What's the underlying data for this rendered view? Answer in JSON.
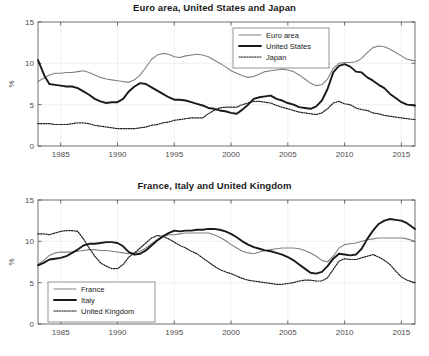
{
  "figure": {
    "background": "#ffffff",
    "axis_color": "#4d4d4d",
    "grid_color": "#e6e6e6"
  },
  "chart_data": [
    {
      "type": "line",
      "title": "Euro area, United States and Japan",
      "xlabel": "",
      "ylabel": "%",
      "xlim": [
        1983,
        2016.2
      ],
      "ylim": [
        0,
        15
      ],
      "xticks": [
        1985,
        1990,
        1995,
        2000,
        2005,
        2010,
        2015
      ],
      "yticks": [
        0,
        5,
        10,
        15
      ],
      "xticklabels": [
        "1985",
        "1990",
        "1995",
        "2000",
        "2005",
        "2010",
        "2015"
      ],
      "yticklabels": [
        "0",
        "5",
        "10",
        "15"
      ],
      "grid": true,
      "legend_position": "top-center-right",
      "series": [
        {
          "name": "Euro area",
          "color": "#808080",
          "style": "solid",
          "width": 1.1,
          "x": [
            1983.0,
            1983.5,
            1984.0,
            1984.5,
            1985.0,
            1985.5,
            1986.0,
            1986.5,
            1987.0,
            1987.5,
            1988.0,
            1988.5,
            1989.0,
            1989.5,
            1990.0,
            1990.5,
            1991.0,
            1991.5,
            1992.0,
            1992.5,
            1993.0,
            1993.5,
            1994.0,
            1994.5,
            1995.0,
            1995.5,
            1996.0,
            1996.5,
            1997.0,
            1997.5,
            1998.0,
            1998.5,
            1999.0,
            1999.5,
            2000.0,
            2000.5,
            2001.0,
            2001.5,
            2002.0,
            2002.5,
            2003.0,
            2003.5,
            2004.0,
            2004.5,
            2005.0,
            2005.5,
            2006.0,
            2006.5,
            2007.0,
            2007.5,
            2008.0,
            2008.5,
            2009.0,
            2009.5,
            2010.0,
            2010.5,
            2011.0,
            2011.5,
            2012.0,
            2012.5,
            2013.0,
            2013.5,
            2014.0,
            2014.5,
            2015.0,
            2015.5,
            2016.2
          ],
          "values": [
            7.8,
            8.2,
            8.6,
            8.8,
            8.8,
            8.9,
            8.9,
            9.0,
            9.1,
            8.9,
            8.6,
            8.3,
            8.1,
            8.0,
            7.9,
            7.8,
            7.7,
            8.0,
            8.6,
            9.5,
            10.5,
            11.0,
            11.2,
            11.1,
            10.8,
            10.7,
            10.9,
            11.0,
            11.1,
            11.0,
            10.8,
            10.4,
            10.0,
            9.6,
            9.1,
            8.8,
            8.5,
            8.3,
            8.4,
            8.7,
            9.0,
            9.1,
            9.2,
            9.3,
            9.2,
            9.0,
            8.6,
            8.1,
            7.6,
            7.3,
            7.4,
            8.1,
            9.4,
            10.0,
            10.1,
            10.1,
            10.2,
            10.6,
            11.3,
            11.9,
            12.1,
            12.0,
            11.7,
            11.3,
            10.9,
            10.5,
            10.3
          ]
        },
        {
          "name": "United States",
          "color": "#1a1a1a",
          "style": "solid",
          "width": 1.9,
          "x": [
            1983.0,
            1983.3,
            1983.6,
            1984.0,
            1984.5,
            1985.0,
            1985.5,
            1986.0,
            1986.5,
            1987.0,
            1987.5,
            1988.0,
            1988.5,
            1989.0,
            1989.5,
            1990.0,
            1990.5,
            1991.0,
            1991.5,
            1992.0,
            1992.5,
            1993.0,
            1993.5,
            1994.0,
            1994.5,
            1995.0,
            1995.5,
            1996.0,
            1996.5,
            1997.0,
            1997.5,
            1998.0,
            1998.5,
            1999.0,
            1999.5,
            2000.0,
            2000.5,
            2001.0,
            2001.5,
            2002.0,
            2002.5,
            2003.0,
            2003.5,
            2004.0,
            2004.5,
            2005.0,
            2005.5,
            2006.0,
            2006.5,
            2007.0,
            2007.5,
            2008.0,
            2008.5,
            2009.0,
            2009.5,
            2010.0,
            2010.5,
            2011.0,
            2011.5,
            2012.0,
            2012.5,
            2013.0,
            2013.5,
            2014.0,
            2014.5,
            2015.0,
            2015.5,
            2016.2
          ],
          "values": [
            10.4,
            9.4,
            8.4,
            7.5,
            7.4,
            7.3,
            7.2,
            7.2,
            7.0,
            6.6,
            6.2,
            5.7,
            5.4,
            5.2,
            5.3,
            5.3,
            5.7,
            6.6,
            7.2,
            7.6,
            7.5,
            7.1,
            6.7,
            6.3,
            5.9,
            5.6,
            5.6,
            5.5,
            5.3,
            5.1,
            4.9,
            4.6,
            4.5,
            4.3,
            4.2,
            4.0,
            3.9,
            4.4,
            5.0,
            5.7,
            5.9,
            6.0,
            6.1,
            5.7,
            5.5,
            5.2,
            5.0,
            4.7,
            4.6,
            4.5,
            4.8,
            5.5,
            6.9,
            8.9,
            9.7,
            9.9,
            9.6,
            9.0,
            8.9,
            8.3,
            7.9,
            7.4,
            7.0,
            6.3,
            5.8,
            5.3,
            5.0,
            4.9
          ]
        },
        {
          "name": "Japan",
          "color": "#1a1a1a",
          "style": "dotted",
          "width": 1.2,
          "x": [
            1983.0,
            1983.5,
            1984.0,
            1984.5,
            1985.0,
            1985.5,
            1986.0,
            1986.5,
            1987.0,
            1987.5,
            1988.0,
            1988.5,
            1989.0,
            1989.5,
            1990.0,
            1990.5,
            1991.0,
            1991.5,
            1992.0,
            1992.5,
            1993.0,
            1993.5,
            1994.0,
            1994.5,
            1995.0,
            1995.5,
            1996.0,
            1996.5,
            1997.0,
            1997.5,
            1998.0,
            1998.5,
            1999.0,
            1999.5,
            2000.0,
            2000.5,
            2001.0,
            2001.5,
            2002.0,
            2002.5,
            2003.0,
            2003.5,
            2004.0,
            2004.5,
            2005.0,
            2005.5,
            2006.0,
            2006.5,
            2007.0,
            2007.5,
            2008.0,
            2008.5,
            2009.0,
            2009.5,
            2010.0,
            2010.5,
            2011.0,
            2011.5,
            2012.0,
            2012.5,
            2013.0,
            2013.5,
            2014.0,
            2014.5,
            2015.0,
            2015.5,
            2016.2
          ],
          "values": [
            2.7,
            2.7,
            2.7,
            2.6,
            2.6,
            2.6,
            2.7,
            2.8,
            2.8,
            2.7,
            2.5,
            2.4,
            2.3,
            2.2,
            2.1,
            2.1,
            2.1,
            2.1,
            2.2,
            2.3,
            2.5,
            2.6,
            2.8,
            2.9,
            3.1,
            3.2,
            3.3,
            3.4,
            3.4,
            3.4,
            3.9,
            4.3,
            4.6,
            4.7,
            4.7,
            4.7,
            5.0,
            5.2,
            5.4,
            5.4,
            5.3,
            5.2,
            4.9,
            4.7,
            4.5,
            4.3,
            4.1,
            4.0,
            3.9,
            3.8,
            4.0,
            4.5,
            5.2,
            5.4,
            5.1,
            5.0,
            4.6,
            4.4,
            4.3,
            4.0,
            3.9,
            3.7,
            3.6,
            3.5,
            3.4,
            3.3,
            3.2
          ]
        }
      ]
    },
    {
      "type": "line",
      "title": "France, Italy and United Kingdom",
      "xlabel": "",
      "ylabel": "%",
      "xlim": [
        1983,
        2016.2
      ],
      "ylim": [
        0,
        15
      ],
      "xticks": [
        1985,
        1990,
        1995,
        2000,
        2005,
        2010,
        2015
      ],
      "yticks": [
        0,
        5,
        10,
        15
      ],
      "xticklabels": [
        "1985",
        "1990",
        "1995",
        "2000",
        "2005",
        "2010",
        "2015"
      ],
      "yticklabels": [
        "0",
        "5",
        "10",
        "15"
      ],
      "grid": true,
      "legend_position": "bottom-left",
      "series": [
        {
          "name": "France",
          "color": "#808080",
          "style": "solid",
          "width": 1.1,
          "x": [
            1983.0,
            1983.5,
            1984.0,
            1984.5,
            1985.0,
            1985.5,
            1986.0,
            1986.5,
            1987.0,
            1987.5,
            1988.0,
            1988.5,
            1989.0,
            1989.5,
            1990.0,
            1990.5,
            1991.0,
            1991.5,
            1992.0,
            1992.5,
            1993.0,
            1993.5,
            1994.0,
            1994.5,
            1995.0,
            1995.5,
            1996.0,
            1996.5,
            1997.0,
            1997.5,
            1998.0,
            1998.5,
            1999.0,
            1999.5,
            2000.0,
            2000.5,
            2001.0,
            2001.5,
            2002.0,
            2002.5,
            2003.0,
            2003.5,
            2004.0,
            2004.5,
            2005.0,
            2005.5,
            2006.0,
            2006.5,
            2007.0,
            2007.5,
            2008.0,
            2008.5,
            2009.0,
            2009.5,
            2010.0,
            2010.5,
            2011.0,
            2011.5,
            2012.0,
            2012.5,
            2013.0,
            2013.5,
            2014.0,
            2014.5,
            2015.0,
            2015.5,
            2016.2
          ],
          "values": [
            7.2,
            7.7,
            8.3,
            8.6,
            8.7,
            8.7,
            8.7,
            8.8,
            8.9,
            9.0,
            9.0,
            8.9,
            8.9,
            8.8,
            8.7,
            8.6,
            8.5,
            8.6,
            8.8,
            9.2,
            9.7,
            10.2,
            10.6,
            10.8,
            10.8,
            10.9,
            11.0,
            11.0,
            11.0,
            11.0,
            11.0,
            10.8,
            10.5,
            10.1,
            9.6,
            9.2,
            8.8,
            8.6,
            8.5,
            8.7,
            8.9,
            9.0,
            9.1,
            9.2,
            9.2,
            9.2,
            9.1,
            8.9,
            8.6,
            8.2,
            7.7,
            7.5,
            8.2,
            9.2,
            9.6,
            9.7,
            9.8,
            10.0,
            10.2,
            10.3,
            10.4,
            10.4,
            10.4,
            10.4,
            10.4,
            10.3,
            10.0
          ]
        },
        {
          "name": "Italy",
          "color": "#1a1a1a",
          "style": "solid",
          "width": 1.9,
          "x": [
            1983.0,
            1983.5,
            1984.0,
            1984.5,
            1985.0,
            1985.5,
            1986.0,
            1986.5,
            1987.0,
            1987.5,
            1988.0,
            1988.5,
            1989.0,
            1989.5,
            1990.0,
            1990.5,
            1991.0,
            1991.5,
            1992.0,
            1992.5,
            1993.0,
            1993.5,
            1994.0,
            1994.5,
            1995.0,
            1995.5,
            1996.0,
            1996.5,
            1997.0,
            1997.5,
            1998.0,
            1998.5,
            1999.0,
            1999.5,
            2000.0,
            2000.5,
            2001.0,
            2001.5,
            2002.0,
            2002.5,
            2003.0,
            2003.5,
            2004.0,
            2004.5,
            2005.0,
            2005.5,
            2006.0,
            2006.5,
            2007.0,
            2007.5,
            2008.0,
            2008.5,
            2009.0,
            2009.5,
            2010.0,
            2010.5,
            2011.0,
            2011.5,
            2012.0,
            2012.5,
            2013.0,
            2013.5,
            2014.0,
            2014.5,
            2015.0,
            2015.5,
            2016.2
          ],
          "values": [
            7.1,
            7.4,
            7.8,
            7.9,
            8.0,
            8.2,
            8.6,
            9.0,
            9.5,
            9.7,
            9.7,
            9.8,
            9.9,
            9.9,
            9.8,
            9.4,
            8.7,
            8.4,
            8.5,
            8.9,
            9.5,
            10.1,
            10.6,
            11.0,
            11.3,
            11.2,
            11.3,
            11.3,
            11.4,
            11.4,
            11.5,
            11.5,
            11.4,
            11.2,
            10.9,
            10.5,
            10.0,
            9.6,
            9.3,
            9.1,
            8.9,
            8.8,
            8.6,
            8.4,
            8.1,
            7.7,
            7.2,
            6.7,
            6.2,
            6.1,
            6.3,
            7.0,
            7.9,
            8.5,
            8.4,
            8.3,
            8.4,
            9.1,
            10.3,
            11.3,
            12.1,
            12.5,
            12.7,
            12.6,
            12.5,
            12.2,
            11.5
          ]
        },
        {
          "name": "United Kingdom",
          "color": "#1a1a1a",
          "style": "dotted",
          "width": 1.2,
          "x": [
            1983.0,
            1983.5,
            1984.0,
            1984.5,
            1985.0,
            1985.5,
            1986.0,
            1986.5,
            1987.0,
            1987.5,
            1988.0,
            1988.5,
            1989.0,
            1989.5,
            1990.0,
            1990.5,
            1991.0,
            1991.5,
            1992.0,
            1992.5,
            1993.0,
            1993.5,
            1994.0,
            1994.5,
            1995.0,
            1995.5,
            1996.0,
            1996.5,
            1997.0,
            1997.5,
            1998.0,
            1998.5,
            1999.0,
            1999.5,
            2000.0,
            2000.5,
            2001.0,
            2001.5,
            2002.0,
            2002.5,
            2003.0,
            2003.5,
            2004.0,
            2004.5,
            2005.0,
            2005.5,
            2006.0,
            2006.5,
            2007.0,
            2007.5,
            2008.0,
            2008.5,
            2009.0,
            2009.5,
            2010.0,
            2010.5,
            2011.0,
            2011.5,
            2012.0,
            2012.5,
            2013.0,
            2013.5,
            2014.0,
            2014.5,
            2015.0,
            2015.5,
            2016.2
          ],
          "values": [
            10.9,
            10.9,
            10.8,
            11.0,
            11.2,
            11.3,
            11.3,
            11.2,
            10.3,
            9.2,
            8.2,
            7.4,
            7.0,
            6.7,
            6.7,
            7.2,
            8.1,
            8.6,
            9.2,
            9.8,
            10.4,
            10.7,
            10.6,
            10.3,
            9.9,
            9.5,
            9.2,
            8.8,
            8.5,
            8.0,
            7.5,
            7.0,
            6.6,
            6.3,
            6.1,
            5.8,
            5.5,
            5.3,
            5.2,
            5.1,
            5.0,
            4.9,
            4.8,
            4.8,
            4.9,
            5.0,
            5.2,
            5.3,
            5.3,
            5.2,
            5.2,
            5.6,
            6.6,
            7.6,
            7.9,
            7.8,
            7.8,
            8.0,
            8.2,
            8.4,
            8.1,
            7.7,
            7.2,
            6.4,
            5.7,
            5.3,
            5.0
          ]
        }
      ]
    }
  ]
}
